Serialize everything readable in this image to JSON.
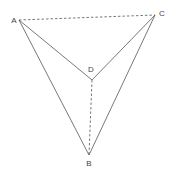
{
  "diagram": {
    "type": "geometry-figure",
    "points": {
      "A": {
        "label": "A",
        "x": 19,
        "y": 20,
        "lx": 14,
        "ly": 23
      },
      "B": {
        "label": "B",
        "x": 89,
        "y": 155,
        "lx": 89,
        "ly": 166
      },
      "C": {
        "label": "C",
        "x": 155,
        "y": 15,
        "lx": 162,
        "ly": 16
      },
      "D": {
        "label": "D",
        "x": 92,
        "y": 80,
        "lx": 91,
        "ly": 72
      }
    },
    "segments": [
      {
        "from": "A",
        "to": "B",
        "style": "solid"
      },
      {
        "from": "A",
        "to": "D",
        "style": "solid"
      },
      {
        "from": "C",
        "to": "D",
        "style": "solid"
      },
      {
        "from": "C",
        "to": "B",
        "style": "solid"
      },
      {
        "from": "A",
        "to": "C",
        "style": "dashed"
      },
      {
        "from": "D",
        "to": "B",
        "style": "dashed"
      }
    ],
    "colors": {
      "line": "#555555",
      "label": "#444444"
    }
  }
}
